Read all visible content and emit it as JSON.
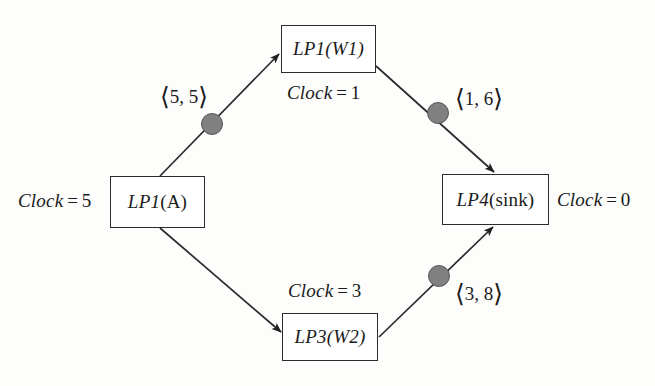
{
  "figure": {
    "background_color": "#fdfdfc",
    "line_color": "#2b2b2b",
    "token_color": "#808080",
    "token_border_color": "#565656"
  },
  "nodes": [
    {
      "id": "lp1a",
      "label": "LP1(A)",
      "prefix": "LP1",
      "suffix": "(A)",
      "clock_label": "Clock",
      "clock_eq": "=",
      "clock_value": "5",
      "clock_text": "Clock = 5",
      "clock_position": "left"
    },
    {
      "id": "lp1w1",
      "label": "LP1(W1)",
      "prefix": "LP1",
      "suffix": "(W1)",
      "clock_label": "Clock",
      "clock_eq": "=",
      "clock_value": "1",
      "clock_text": "Clock = 1",
      "clock_position": "below"
    },
    {
      "id": "lp3w2",
      "label": "LP3(W2)",
      "prefix": "LP3",
      "suffix": "(W2)",
      "clock_label": "Clock",
      "clock_eq": "=",
      "clock_value": "3",
      "clock_text": "Clock = 3",
      "clock_position": "above"
    },
    {
      "id": "lp4sink",
      "label": "LP4(sink)",
      "prefix": "LP4",
      "suffix": "(sink)",
      "clock_label": "Clock",
      "clock_eq": "=",
      "clock_value": "0",
      "clock_text": "Clock = 0",
      "clock_position": "right"
    }
  ],
  "messages": [
    {
      "id": "m_5_5",
      "open": "⟨",
      "close": "⟩",
      "values": "5, 5",
      "text": "⟨5, 5⟩",
      "on_edge": "lp1a-to-lp1w1"
    },
    {
      "id": "m_1_6",
      "open": "⟨",
      "close": "⟩",
      "values": "1, 6",
      "text": "⟨1, 6⟩",
      "on_edge": "lp1w1-to-lp4sink"
    },
    {
      "id": "m_3_8",
      "open": "⟨",
      "close": "⟩",
      "values": "3, 8",
      "text": "⟨3, 8⟩",
      "on_edge": "lp3w2-to-lp4sink"
    }
  ],
  "edges": [
    {
      "id": "lp1a-to-lp1w1",
      "from": "lp1a",
      "to": "lp1w1",
      "direction": "up-right"
    },
    {
      "id": "lp1w1-to-lp4sink",
      "from": "lp1w1",
      "to": "lp4sink",
      "direction": "down-right"
    },
    {
      "id": "lp1a-to-lp3w2",
      "from": "lp1a",
      "to": "lp3w2",
      "direction": "down-right"
    },
    {
      "id": "lp3w2-to-lp4sink",
      "from": "lp3w2",
      "to": "lp4sink",
      "direction": "up-right"
    }
  ]
}
